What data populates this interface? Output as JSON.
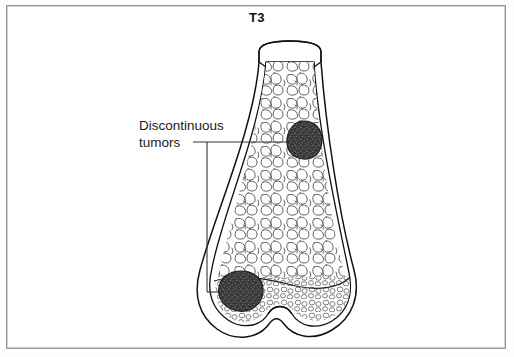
{
  "figure": {
    "title": "T3",
    "type": "medical-illustration",
    "border_color": "#9a9a9a",
    "background": "#ffffff"
  },
  "labels": {
    "tumor_label_line1": "Discontinuous",
    "tumor_label_line2": "tumors"
  },
  "colors": {
    "outline": "#111111",
    "tumor_fill": "#3a3a3a",
    "trabecular_stroke": "#444444",
    "leader_line": "#333333",
    "text": "#1a1a1a"
  },
  "annotations": [
    {
      "name": "upper-tumor",
      "description": "dark stippled tumor in metaphyseal trabecular bone",
      "cx": 304,
      "cy": 140,
      "rx": 17,
      "ry": 19
    },
    {
      "name": "lower-tumor",
      "description": "dark stippled tumor in medial condyle epiphysis",
      "cx": 240,
      "cy": 292,
      "rx": 23,
      "ry": 20
    }
  ],
  "leader": {
    "label_anchor_x": 193,
    "label_anchor_y": 142,
    "upper_end_x": 292,
    "upper_end_y": 142,
    "drop_x": 207,
    "drop_bottom_y": 292,
    "lower_end_x": 228,
    "lower_end_y": 292
  }
}
